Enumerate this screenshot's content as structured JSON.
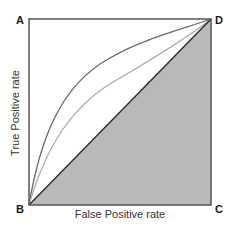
{
  "diagram": {
    "type": "ROC space diagram",
    "corners": {
      "A": "A",
      "B": "B",
      "C": "C",
      "D": "D"
    },
    "axes": {
      "x_label": "False Positive rate",
      "y_label": "True Positive rate"
    },
    "elements": [
      {
        "id": "frame",
        "description": "square plot frame from B(0,0) to D(1,1)"
      },
      {
        "id": "diagonal",
        "description": "straight line from B to D (random classifier)",
        "color": "#2a2a2a"
      },
      {
        "id": "shaded-region",
        "description": "triangle B-C-D below diagonal",
        "color": "#b8b8b8"
      },
      {
        "id": "roc-curve-outer",
        "description": "concave ROC curve from B to D, better classifier",
        "color": "#666666"
      },
      {
        "id": "roc-curve-inner",
        "description": "concave ROC curve from B to D, weaker classifier",
        "color": "#a8a8a8"
      }
    ],
    "colors": {
      "frame": "#555555",
      "shade": "#b9b9b9",
      "diagonal": "#2b2b2b",
      "curve_outer": "#676767",
      "curve_inner": "#a9a9a9",
      "text": "#222222"
    }
  }
}
